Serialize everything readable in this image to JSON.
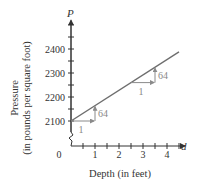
{
  "chart_data": {
    "type": "line",
    "title": "",
    "xlabel": "Depth (in feet)",
    "ylabel": "Pressure (in pounds per square foot)",
    "ylabel_lines": [
      "Pressure",
      "(in pounds per square foot)"
    ],
    "x_var": "d",
    "y_var": "P",
    "origin_label": "0",
    "xlim": [
      0,
      4.5
    ],
    "ylim": [
      2100,
      2400
    ],
    "y_axis_break": true,
    "x_ticks": [
      1,
      2,
      3,
      4
    ],
    "x_tick_labels": [
      "1",
      "2",
      "3",
      "4"
    ],
    "x_minor_step": 0.5,
    "y_ticks": [
      2100,
      2200,
      2300,
      2400
    ],
    "y_tick_labels": [
      "2100",
      "2200",
      "2300",
      "2400"
    ],
    "y_minor_step": 50,
    "grid": false,
    "legend": null,
    "series": [
      {
        "name": "P = 64d + 2100",
        "x": [
          0,
          4.5
        ],
        "y": [
          2100,
          2388
        ],
        "color": "#6e6e6e"
      }
    ],
    "annotations": [
      {
        "type": "slope-triangle",
        "run": 1,
        "rise": 64,
        "at_x": 0,
        "at_y": 2100,
        "run_label": "1",
        "rise_label": "64"
      },
      {
        "type": "slope-triangle",
        "run": 1,
        "rise": 64,
        "at_x": 2.5,
        "at_y": 2260,
        "run_label": "1",
        "rise_label": "64"
      }
    ],
    "annotation_color": "#8a8a8a"
  }
}
